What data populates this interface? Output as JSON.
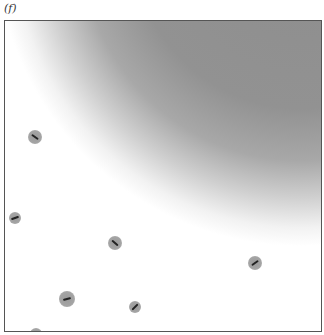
{
  "panel": {
    "label": "(f)",
    "frame": {
      "left": 4,
      "top": 20,
      "width": 318,
      "height": 312,
      "border_color": "#555555"
    },
    "shaded_region": {
      "shape": "circular-gradient",
      "center_x": 296,
      "center_y": -80,
      "radius": 305,
      "dark_color": "#8d8d8d",
      "light_color": "#ffffff"
    },
    "particles": [
      {
        "x": 30,
        "y": 116,
        "r": 7,
        "angle": 35
      },
      {
        "x": 10,
        "y": 197,
        "r": 6,
        "angle": -20
      },
      {
        "x": 110,
        "y": 222,
        "r": 7,
        "angle": 40
      },
      {
        "x": 250,
        "y": 242,
        "r": 7,
        "angle": -35
      },
      {
        "x": 62,
        "y": 278,
        "r": 8,
        "angle": -15
      },
      {
        "x": 130,
        "y": 286,
        "r": 6,
        "angle": -45
      },
      {
        "x": 31,
        "y": 313,
        "r": 6,
        "angle": 0
      }
    ]
  }
}
